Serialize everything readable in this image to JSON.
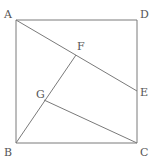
{
  "diagram": {
    "type": "geometry",
    "colors": {
      "line": "#7a7a7a",
      "label": "#555555",
      "background": "#ffffff"
    },
    "points": {
      "A": {
        "label": "A",
        "x": 16,
        "y": 20
      },
      "B": {
        "label": "B",
        "x": 16,
        "y": 143
      },
      "C": {
        "label": "C",
        "x": 137,
        "y": 143
      },
      "D": {
        "label": "D",
        "x": 137,
        "y": 20
      },
      "E": {
        "label": "E",
        "x": 137,
        "y": 91
      },
      "F": {
        "label": "F",
        "x": 76,
        "y": 55
      },
      "G": {
        "label": "G",
        "x": 44,
        "y": 100
      }
    },
    "segments": [
      "AB",
      "BC",
      "CD",
      "DA",
      "AE",
      "BF",
      "CG"
    ]
  }
}
